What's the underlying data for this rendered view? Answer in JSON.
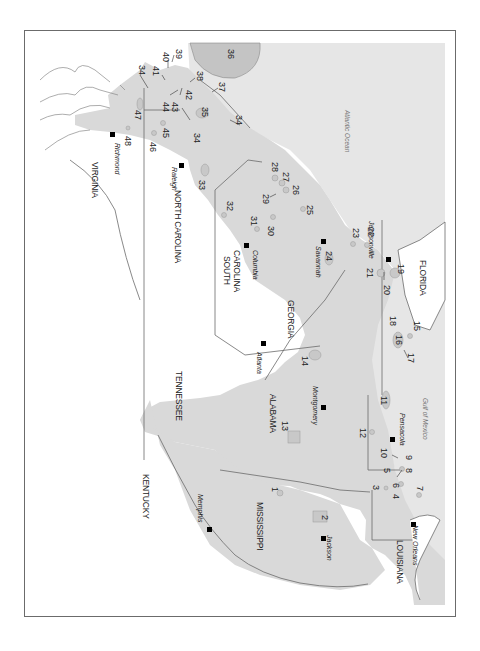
{
  "map": {
    "orientation": "rotated 90 degrees clockwise",
    "colors": {
      "shaded_region": "#dcdcdc",
      "ocean": "#e6e6e6",
      "border": "#6b6b6b",
      "land": "#ffffff",
      "marker": "#000000"
    },
    "states": [
      {
        "name": "VIRGINIA"
      },
      {
        "name": "NORTH CAROLINA"
      },
      {
        "name": "SOUTH CAROLINA",
        "line1": "SOUTH",
        "line2": "CAROLINA"
      },
      {
        "name": "TENNESSEE"
      },
      {
        "name": "GEORGIA"
      },
      {
        "name": "ALABAMA"
      },
      {
        "name": "FLORIDA"
      },
      {
        "name": "KENTUCKY"
      },
      {
        "name": "MISSISSIPPI"
      },
      {
        "name": "LOUISIANA"
      }
    ],
    "cities": [
      {
        "name": "Richmond"
      },
      {
        "name": "Raleigh"
      },
      {
        "name": "Columbia"
      },
      {
        "name": "Savannah"
      },
      {
        "name": "Jacksonville"
      },
      {
        "name": "Atlanta"
      },
      {
        "name": "Montgomery"
      },
      {
        "name": "Pensacola"
      },
      {
        "name": "Memphis"
      },
      {
        "name": "Jackson"
      },
      {
        "name": "New Orleans"
      }
    ],
    "water_bodies": [
      {
        "name": "Atlantic Ocean"
      },
      {
        "name": "Gulf of Mexico"
      }
    ],
    "site_numbers": [
      "1",
      "2",
      "3",
      "4",
      "5",
      "6",
      "7",
      "8",
      "9",
      "10",
      "11",
      "12",
      "13",
      "14",
      "15",
      "16",
      "17",
      "18",
      "19",
      "20",
      "21",
      "22",
      "23",
      "24",
      "25",
      "26",
      "27",
      "28",
      "29",
      "30",
      "31",
      "32",
      "33",
      "34",
      "35",
      "36",
      "37",
      "38",
      "39",
      "40",
      "41",
      "42",
      "43",
      "44",
      "45",
      "46",
      "47",
      "48"
    ]
  }
}
